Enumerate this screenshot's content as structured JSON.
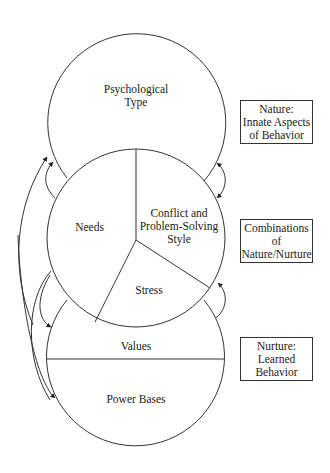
{
  "diagram": {
    "circles": {
      "top": {
        "label": "Psychological\nType"
      },
      "middle": {
        "segments": [
          {
            "label": "Needs"
          },
          {
            "label": "Conflict and\nProblem-Solving\nStyle"
          },
          {
            "label": "Stress"
          }
        ]
      },
      "bottom": {
        "segments": [
          {
            "label": "Values"
          },
          {
            "label": "Power Bases"
          }
        ]
      }
    },
    "legend_boxes": [
      {
        "label": "Nature:\nInnate Aspects\nof Behavior"
      },
      {
        "label": "Combinations\nof\nNature/Nurture"
      },
      {
        "label": "Nurture:\nLearned\nBehavior"
      }
    ],
    "colors": {
      "stroke": "#333333",
      "background": "#ffffff",
      "text": "#1a1a1a"
    }
  }
}
